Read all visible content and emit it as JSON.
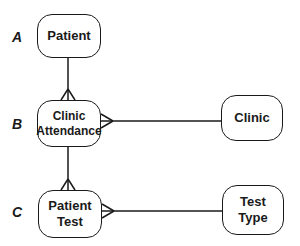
{
  "diagram": {
    "type": "entity-relationship",
    "levels": [
      {
        "id": "A",
        "label": "A"
      },
      {
        "id": "B",
        "label": "B"
      },
      {
        "id": "C",
        "label": "C"
      }
    ],
    "entities": {
      "patient": {
        "label": "Patient"
      },
      "clinic_attendance": {
        "label": "Clinic\nAttendance"
      },
      "clinic": {
        "label": "Clinic"
      },
      "patient_test": {
        "label": "Patient\nTest"
      },
      "test_type": {
        "label": "Test\nType"
      }
    },
    "relationships": [
      {
        "from": "Patient",
        "to": "Clinic Attendance",
        "cardinality": "one-to-many"
      },
      {
        "from": "Clinic",
        "to": "Clinic Attendance",
        "cardinality": "one-to-many"
      },
      {
        "from": "Clinic Attendance",
        "to": "Patient Test",
        "cardinality": "one-to-many"
      },
      {
        "from": "Test Type",
        "to": "Patient Test",
        "cardinality": "one-to-many"
      }
    ],
    "colors": {
      "stroke": "#1a1a1a",
      "background": "#ffffff"
    }
  }
}
